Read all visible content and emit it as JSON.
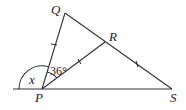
{
  "diagram": {
    "points": {
      "P": {
        "label": "P",
        "x": 42,
        "y": 89
      },
      "Q": {
        "label": "Q",
        "x": 65,
        "y": 13
      },
      "R": {
        "label": "R",
        "x": 105,
        "y": 42
      },
      "S": {
        "label": "S",
        "x": 172,
        "y": 89
      }
    },
    "segments": [
      "PQ",
      "QS",
      "PR",
      "PS",
      "baseline extension left of P"
    ],
    "equal_marks": [
      "PQ",
      "PR",
      "RS"
    ],
    "angles": {
      "QPR": {
        "label": "36°"
      },
      "exterior_at_P": {
        "label": "x"
      }
    }
  }
}
